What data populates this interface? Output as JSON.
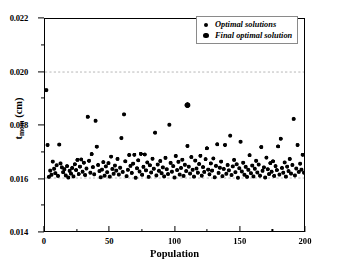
{
  "chart_data": {
    "type": "scatter",
    "title": "",
    "xlabel": "Population",
    "ylabel_main": "t",
    "ylabel_sub": "mcm",
    "ylabel_unit": " (cm)",
    "xlim": [
      0,
      200
    ],
    "ylim": [
      0.014,
      0.022
    ],
    "xticks": [
      0,
      50,
      100,
      150,
      200
    ],
    "xtick_labels": [
      "0",
      "50",
      "100",
      "150",
      "200"
    ],
    "xticks_minor": [
      25,
      75,
      125,
      175
    ],
    "yticks": [
      0.014,
      0.016,
      0.018,
      0.02,
      0.022
    ],
    "ytick_labels": [
      "0.014",
      "0.016",
      "0.018",
      "0.020",
      "0.022"
    ],
    "yticks_minor": [
      0.015,
      0.017,
      0.019,
      0.021
    ],
    "grid": "horizontal dashed gridlines at y=0.016 and y=0.020",
    "gridlines": [
      0.016,
      0.02
    ],
    "legend_position": "top-right inside axes",
    "marker_color": "#000000",
    "series": [
      {
        "name": "Optimal solutions",
        "marker": "filled-circle",
        "marker_size": 4,
        "points": [
          [
            1,
            0.01932
          ],
          [
            2,
            0.01725
          ],
          [
            3,
            0.01604
          ],
          [
            4,
            0.01628
          ],
          [
            5,
            0.01612
          ],
          [
            6,
            0.01662
          ],
          [
            7,
            0.01635
          ],
          [
            8,
            0.01618
          ],
          [
            9,
            0.01648
          ],
          [
            10,
            0.01608
          ],
          [
            11,
            0.01726
          ],
          [
            12,
            0.01655
          ],
          [
            13,
            0.0164
          ],
          [
            14,
            0.01622
          ],
          [
            15,
            0.01633
          ],
          [
            16,
            0.0161
          ],
          [
            17,
            0.01645
          ],
          [
            18,
            0.01602
          ],
          [
            19,
            0.01627
          ],
          [
            20,
            0.01617
          ],
          [
            21,
            0.01638
          ],
          [
            22,
            0.01606
          ],
          [
            23,
            0.01652
          ],
          [
            24,
            0.0163
          ],
          [
            25,
            0.01668
          ],
          [
            26,
            0.01615
          ],
          [
            27,
            0.01643
          ],
          [
            28,
            0.0167
          ],
          [
            29,
            0.01624
          ],
          [
            30,
            0.01658
          ],
          [
            31,
            0.01611
          ],
          [
            32,
            0.01636
          ],
          [
            33,
            0.01831
          ],
          [
            34,
            0.01665
          ],
          [
            35,
            0.0162
          ],
          [
            36,
            0.0169
          ],
          [
            37,
            0.01641
          ],
          [
            38,
            0.01614
          ],
          [
            39,
            0.01816
          ],
          [
            40,
            0.01718
          ],
          [
            41,
            0.01649
          ],
          [
            42,
            0.01626
          ],
          [
            43,
            0.01603
          ],
          [
            44,
            0.01632
          ],
          [
            45,
            0.0166
          ],
          [
            46,
            0.01609
          ],
          [
            47,
            0.01644
          ],
          [
            48,
            0.01622
          ],
          [
            49,
            0.01656
          ],
          [
            50,
            0.01605
          ],
          [
            51,
            0.01681
          ],
          [
            52,
            0.01634
          ],
          [
            53,
            0.01616
          ],
          [
            54,
            0.01647
          ],
          [
            55,
            0.01628
          ],
          [
            56,
            0.01672
          ],
          [
            57,
            0.01613
          ],
          [
            58,
            0.01639
          ],
          [
            59,
            0.01751
          ],
          [
            60,
            0.01623
          ],
          [
            61,
            0.0184
          ],
          [
            62,
            0.01663
          ],
          [
            63,
            0.01607
          ],
          [
            64,
            0.01631
          ],
          [
            65,
            0.01687
          ],
          [
            66,
            0.01646
          ],
          [
            67,
            0.01619
          ],
          [
            68,
            0.01654
          ],
          [
            69,
            0.01688
          ],
          [
            70,
            0.01601
          ],
          [
            71,
            0.01637
          ],
          [
            72,
            0.01667
          ],
          [
            73,
            0.01625
          ],
          [
            74,
            0.01691
          ],
          [
            75,
            0.01612
          ],
          [
            76,
            0.01642
          ],
          [
            77,
            0.01689
          ],
          [
            78,
            0.01629
          ],
          [
            79,
            0.01659
          ],
          [
            80,
            0.01604
          ],
          [
            81,
            0.01648
          ],
          [
            82,
            0.01621
          ],
          [
            83,
            0.01673
          ],
          [
            84,
            0.01635
          ],
          [
            85,
            0.01771
          ],
          [
            86,
            0.0161
          ],
          [
            87,
            0.01651
          ],
          [
            88,
            0.01627
          ],
          [
            89,
            0.01664
          ],
          [
            90,
            0.01618
          ],
          [
            91,
            0.0164
          ],
          [
            92,
            0.01606
          ],
          [
            93,
            0.01676
          ],
          [
            94,
            0.01633
          ],
          [
            95,
            0.01615
          ],
          [
            96,
            0.01801
          ],
          [
            97,
            0.01657
          ],
          [
            98,
            0.01624
          ],
          [
            99,
            0.01645
          ],
          [
            100,
            0.01602
          ],
          [
            101,
            0.01683
          ],
          [
            102,
            0.0163
          ],
          [
            103,
            0.01661
          ],
          [
            104,
            0.01613
          ],
          [
            105,
            0.01638
          ],
          [
            106,
            0.01669
          ],
          [
            107,
            0.01608
          ],
          [
            108,
            0.0165
          ],
          [
            109,
            0.01626
          ],
          [
            110,
            0.01721
          ],
          [
            111,
            0.01643
          ],
          [
            112,
            0.01617
          ],
          [
            113,
            0.01679
          ],
          [
            114,
            0.01631
          ],
          [
            115,
            0.01605
          ],
          [
            116,
            0.01666
          ],
          [
            117,
            0.01636
          ],
          [
            118,
            0.0162
          ],
          [
            119,
            0.01653
          ],
          [
            120,
            0.01684
          ],
          [
            121,
            0.01609
          ],
          [
            122,
            0.01641
          ],
          [
            123,
            0.01623
          ],
          [
            124,
            0.01671
          ],
          [
            125,
            0.01712
          ],
          [
            126,
            0.01632
          ],
          [
            127,
            0.01614
          ],
          [
            128,
            0.01655
          ],
          [
            129,
            0.01628
          ],
          [
            130,
            0.01674
          ],
          [
            131,
            0.01603
          ],
          [
            132,
            0.01646
          ],
          [
            133,
            0.01727
          ],
          [
            134,
            0.01619
          ],
          [
            135,
            0.01639
          ],
          [
            136,
            0.01662
          ],
          [
            137,
            0.01607
          ],
          [
            138,
            0.01634
          ],
          [
            139,
            0.01725
          ],
          [
            140,
            0.01616
          ],
          [
            141,
            0.01649
          ],
          [
            142,
            0.01629
          ],
          [
            143,
            0.0176
          ],
          [
            144,
            0.01611
          ],
          [
            145,
            0.01644
          ],
          [
            146,
            0.01668
          ],
          [
            147,
            0.01622
          ],
          [
            148,
            0.01652
          ],
          [
            149,
            0.01601
          ],
          [
            150,
            0.01637
          ],
          [
            151,
            0.01737
          ],
          [
            152,
            0.01625
          ],
          [
            153,
            0.01658
          ],
          [
            154,
            0.01612
          ],
          [
            155,
            0.01642
          ],
          [
            156,
            0.01604
          ],
          [
            157,
            0.01631
          ],
          [
            158,
            0.01686
          ],
          [
            159,
            0.01618
          ],
          [
            160,
            0.01647
          ],
          [
            161,
            0.01606
          ],
          [
            162,
            0.01635
          ],
          [
            163,
            0.01665
          ],
          [
            164,
            0.01621
          ],
          [
            165,
            0.01651
          ],
          [
            166,
            0.01609
          ],
          [
            167,
            0.01717
          ],
          [
            168,
            0.01627
          ],
          [
            169,
            0.0164
          ],
          [
            170,
            0.01602
          ],
          [
            171,
            0.01677
          ],
          [
            172,
            0.01633
          ],
          [
            173,
            0.01615
          ],
          [
            174,
            0.01656
          ],
          [
            175,
            0.01624
          ],
          [
            176,
            0.01663
          ],
          [
            177,
            0.01608
          ],
          [
            178,
            0.01645
          ],
          [
            179,
            0.0163
          ],
          [
            180,
            0.01719
          ],
          [
            181,
            0.01613
          ],
          [
            182,
            0.01748
          ],
          [
            183,
            0.01638
          ],
          [
            184,
            0.0162
          ],
          [
            185,
            0.01659
          ],
          [
            186,
            0.01605
          ],
          [
            187,
            0.01643
          ],
          [
            188,
            0.01626
          ],
          [
            189,
            0.01672
          ],
          [
            190,
            0.01617
          ],
          [
            191,
            0.01649
          ],
          [
            192,
            0.01823
          ],
          [
            193,
            0.0161
          ],
          [
            194,
            0.01636
          ],
          [
            195,
            0.01725
          ],
          [
            196,
            0.01623
          ],
          [
            197,
            0.01654
          ],
          [
            198,
            0.01632
          ],
          [
            199,
            0.01688
          ],
          [
            200,
            0.0162
          ]
        ]
      },
      {
        "name": "Final optimal solution",
        "marker": "filled-circle",
        "marker_size": 6,
        "points": [
          [
            110,
            0.01875
          ]
        ]
      }
    ]
  },
  "legend": {
    "items": [
      {
        "label": "Optimal solutions",
        "swatch": "small-dot-marker"
      },
      {
        "label": "Final optimal solution",
        "swatch": "large-dot-marker"
      }
    ]
  }
}
